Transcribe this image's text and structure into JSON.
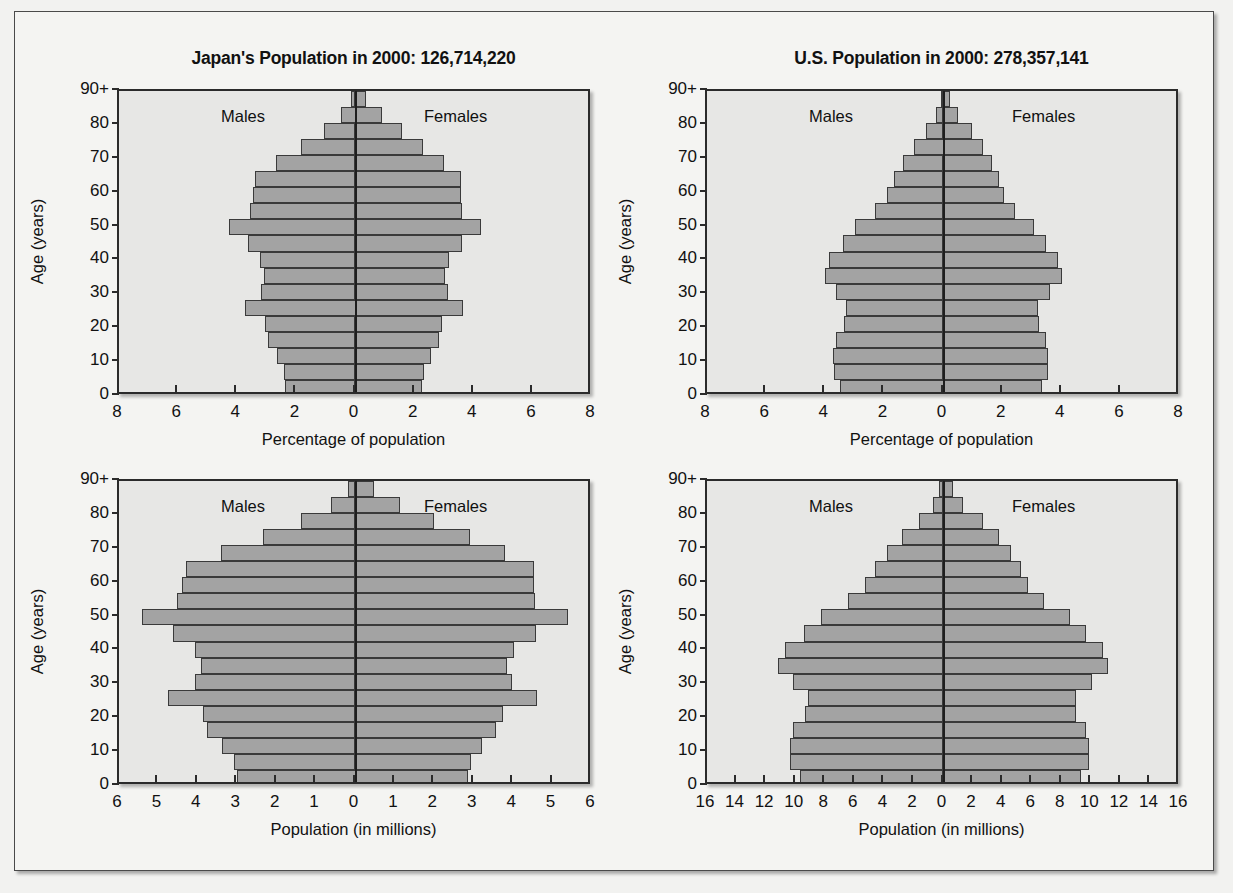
{
  "figure": {
    "background_color": "#f4f4f2",
    "plot_background_color": "#e7e7e5",
    "bar_fill_color": "#a3a3a3",
    "bar_edge_color": "#3a3a3a",
    "axis_color": "#2b2b2b"
  },
  "common": {
    "males_label": "Males",
    "females_label": "Females",
    "y_axis_title": "Age (years)",
    "y_tick_labels": [
      "0",
      "10",
      "20",
      "30",
      "40",
      "50",
      "60",
      "70",
      "80",
      "90+"
    ],
    "age_groups": [
      "0-4",
      "5-9",
      "10-14",
      "15-19",
      "20-24",
      "25-29",
      "30-34",
      "35-39",
      "40-44",
      "45-49",
      "50-54",
      "55-59",
      "60-64",
      "65-69",
      "70-74",
      "75-79",
      "80-84",
      "85-89",
      "90+"
    ]
  },
  "panels": [
    {
      "id": "japan-percent",
      "title": "Japan's Population in 2000: 126,714,220",
      "x_axis_title": "Percentage of population",
      "x_tick_labels": [
        "8",
        "6",
        "4",
        "2",
        "0",
        "2",
        "4",
        "6",
        "8"
      ]
    },
    {
      "id": "us-percent",
      "title": "U.S. Population in 2000: 278,357,141",
      "x_axis_title": "Percentage of population",
      "x_tick_labels": [
        "8",
        "6",
        "4",
        "2",
        "0",
        "2",
        "4",
        "6",
        "8"
      ]
    },
    {
      "id": "japan-millions",
      "title": "",
      "x_axis_title": "Population (in millions)",
      "x_tick_labels": [
        "6",
        "5",
        "4",
        "3",
        "2",
        "1",
        "0",
        "1",
        "2",
        "3",
        "4",
        "5",
        "6"
      ]
    },
    {
      "id": "us-millions",
      "title": "",
      "x_axis_title": "Population (in millions)",
      "x_tick_labels": [
        "16",
        "14",
        "12",
        "10",
        "8",
        "6",
        "4",
        "2",
        "0",
        "2",
        "4",
        "6",
        "8",
        "10",
        "12",
        "14",
        "16"
      ]
    }
  ],
  "chart_data": [
    {
      "type": "bar",
      "id": "japan-percent",
      "subtype": "population-pyramid",
      "title": "Japan's Population in 2000: 126,714,220",
      "xlabel": "Percentage of population",
      "ylabel": "Age (years)",
      "xlim": [
        -8,
        8
      ],
      "x_ticks": [
        -8,
        -6,
        -4,
        -2,
        0,
        2,
        4,
        6,
        8
      ],
      "x_tick_labels": [
        "8",
        "6",
        "4",
        "2",
        "0",
        "2",
        "4",
        "6",
        "8"
      ],
      "y_ticks": [
        0,
        10,
        20,
        30,
        40,
        50,
        60,
        70,
        80,
        90
      ],
      "y_tick_labels": [
        "0",
        "10",
        "20",
        "30",
        "40",
        "50",
        "60",
        "70",
        "80",
        "90+"
      ],
      "grid": false,
      "legend": [
        "Males",
        "Females"
      ],
      "legend_position": "inside-top",
      "categories": [
        "0-4",
        "5-9",
        "10-14",
        "15-19",
        "20-24",
        "25-29",
        "30-34",
        "35-39",
        "40-44",
        "45-49",
        "50-54",
        "55-59",
        "60-64",
        "65-69",
        "70-74",
        "75-79",
        "80-84",
        "85-89",
        "90+"
      ],
      "series": [
        {
          "name": "Males",
          "values": [
            2.37,
            2.43,
            2.67,
            2.97,
            3.05,
            3.75,
            3.2,
            3.1,
            3.22,
            3.65,
            4.28,
            3.58,
            3.48,
            3.4,
            2.7,
            1.85,
            1.08,
            0.5,
            0.16
          ]
        },
        {
          "name": "Females",
          "values": [
            2.25,
            2.31,
            2.54,
            2.82,
            2.94,
            3.64,
            3.13,
            3.04,
            3.17,
            3.61,
            4.26,
            3.6,
            3.57,
            3.58,
            3.0,
            2.3,
            1.58,
            0.88,
            0.36
          ]
        }
      ]
    },
    {
      "type": "bar",
      "id": "us-percent",
      "subtype": "population-pyramid",
      "title": "U.S. Population in 2000: 278,357,141",
      "xlabel": "Percentage of population",
      "ylabel": "Age (years)",
      "xlim": [
        -8,
        8
      ],
      "x_ticks": [
        -8,
        -6,
        -4,
        -2,
        0,
        2,
        4,
        6,
        8
      ],
      "x_tick_labels": [
        "8",
        "6",
        "4",
        "2",
        "0",
        "2",
        "4",
        "6",
        "8"
      ],
      "y_ticks": [
        0,
        10,
        20,
        30,
        40,
        50,
        60,
        70,
        80,
        90
      ],
      "y_tick_labels": [
        "0",
        "10",
        "20",
        "30",
        "40",
        "50",
        "60",
        "70",
        "80",
        "90+"
      ],
      "grid": false,
      "legend": [
        "Males",
        "Females"
      ],
      "legend_position": "inside-top",
      "categories": [
        "0-4",
        "5-9",
        "10-14",
        "15-19",
        "20-24",
        "25-29",
        "30-34",
        "35-39",
        "40-44",
        "45-49",
        "50-54",
        "55-59",
        "60-64",
        "65-69",
        "70-74",
        "75-79",
        "80-84",
        "85-89",
        "90+"
      ],
      "series": [
        {
          "name": "Males",
          "values": [
            3.5,
            3.72,
            3.73,
            3.65,
            3.36,
            3.3,
            3.65,
            4.02,
            3.86,
            3.4,
            2.98,
            2.32,
            1.9,
            1.66,
            1.36,
            1.0,
            0.6,
            0.26,
            0.1
          ]
        },
        {
          "name": "Females",
          "values": [
            3.34,
            3.54,
            3.54,
            3.47,
            3.22,
            3.21,
            3.61,
            4.0,
            3.88,
            3.46,
            3.07,
            2.43,
            2.05,
            1.88,
            1.65,
            1.35,
            0.95,
            0.48,
            0.22
          ]
        }
      ]
    },
    {
      "type": "bar",
      "id": "japan-millions",
      "subtype": "population-pyramid",
      "title": "",
      "xlabel": "Population (in millions)",
      "ylabel": "Age (years)",
      "xlim": [
        -6,
        6
      ],
      "x_ticks": [
        -6,
        -5,
        -4,
        -3,
        -2,
        -1,
        0,
        1,
        2,
        3,
        4,
        5,
        6
      ],
      "x_tick_labels": [
        "6",
        "5",
        "4",
        "3",
        "2",
        "1",
        "0",
        "1",
        "2",
        "3",
        "4",
        "5",
        "6"
      ],
      "y_ticks": [
        0,
        10,
        20,
        30,
        40,
        50,
        60,
        70,
        80,
        90
      ],
      "y_tick_labels": [
        "0",
        "10",
        "20",
        "30",
        "40",
        "50",
        "60",
        "70",
        "80",
        "90+"
      ],
      "grid": false,
      "legend": [
        "Males",
        "Females"
      ],
      "legend_position": "inside-top",
      "categories": [
        "0-4",
        "5-9",
        "10-14",
        "15-19",
        "20-24",
        "25-29",
        "30-34",
        "35-39",
        "40-44",
        "45-49",
        "50-54",
        "55-59",
        "60-64",
        "65-69",
        "70-74",
        "75-79",
        "80-84",
        "85-89",
        "90+"
      ],
      "series": [
        {
          "name": "Males",
          "values": [
            3.0,
            3.08,
            3.38,
            3.76,
            3.86,
            4.75,
            4.06,
            3.93,
            4.08,
            4.63,
            5.42,
            4.54,
            4.41,
            4.31,
            3.42,
            2.34,
            1.37,
            0.63,
            0.2
          ]
        },
        {
          "name": "Females",
          "values": [
            2.85,
            2.93,
            3.22,
            3.57,
            3.73,
            4.61,
            3.97,
            3.85,
            4.02,
            4.57,
            5.4,
            4.56,
            4.52,
            4.54,
            3.8,
            2.91,
            2.0,
            1.12,
            0.46
          ]
        }
      ]
    },
    {
      "type": "bar",
      "id": "us-millions",
      "subtype": "population-pyramid",
      "title": "",
      "xlabel": "Population (in millions)",
      "ylabel": "Age (years)",
      "xlim": [
        -16,
        16
      ],
      "x_ticks": [
        -16,
        -14,
        -12,
        -10,
        -8,
        -6,
        -4,
        -2,
        0,
        2,
        4,
        6,
        8,
        10,
        12,
        14,
        16
      ],
      "x_tick_labels": [
        "16",
        "14",
        "12",
        "10",
        "8",
        "6",
        "4",
        "2",
        "0",
        "2",
        "4",
        "6",
        "8",
        "10",
        "12",
        "14",
        "16"
      ],
      "y_ticks": [
        0,
        10,
        20,
        30,
        40,
        50,
        60,
        70,
        80,
        90
      ],
      "y_tick_labels": [
        "0",
        "10",
        "20",
        "30",
        "40",
        "50",
        "60",
        "70",
        "80",
        "90+"
      ],
      "grid": false,
      "legend": [
        "Males",
        "Females"
      ],
      "legend_position": "inside-top",
      "categories": [
        "0-4",
        "5-9",
        "10-14",
        "15-19",
        "20-24",
        "25-29",
        "30-34",
        "35-39",
        "40-44",
        "45-49",
        "50-54",
        "55-59",
        "60-64",
        "65-69",
        "70-74",
        "75-79",
        "80-84",
        "85-89",
        "90+"
      ],
      "series": [
        {
          "name": "Males",
          "values": [
            9.74,
            10.36,
            10.38,
            10.16,
            9.35,
            9.19,
            10.16,
            11.19,
            10.75,
            9.46,
            8.3,
            6.46,
            5.29,
            4.62,
            3.79,
            2.78,
            1.67,
            0.72,
            0.28
          ]
        },
        {
          "name": "Females",
          "values": [
            9.3,
            9.86,
            9.85,
            9.66,
            8.96,
            8.94,
            10.05,
            11.14,
            10.8,
            9.63,
            8.55,
            6.77,
            5.71,
            5.23,
            4.59,
            3.76,
            2.64,
            1.34,
            0.61
          ]
        }
      ]
    }
  ]
}
